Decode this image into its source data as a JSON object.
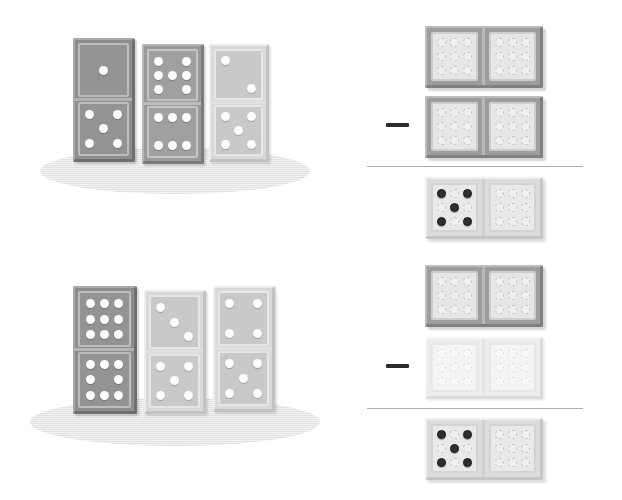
{
  "page": {
    "background_color": "#ffffff",
    "accent_dark": "#2e2e2e",
    "rule_color": "#aeaeae",
    "shadow_color": "#e2e2e2"
  },
  "problems": [
    {
      "id": "problem-1",
      "standing_dominoes": [
        {
          "name": "domino-1",
          "tone": "dark",
          "top_pips": 1,
          "bottom_pips": 5,
          "top_pattern": [
            0,
            0,
            0,
            0,
            1,
            0,
            0,
            0,
            0
          ],
          "bottom_pattern": [
            1,
            0,
            1,
            0,
            1,
            0,
            1,
            0,
            1
          ]
        },
        {
          "name": "domino-2",
          "tone": "mid",
          "top_pips": 7,
          "bottom_pips": 6,
          "top_pattern": [
            1,
            0,
            1,
            1,
            1,
            1,
            1,
            0,
            1
          ],
          "bottom_pattern": [
            1,
            1,
            1,
            0,
            0,
            0,
            1,
            1,
            1
          ]
        },
        {
          "name": "domino-3",
          "tone": "light",
          "top_pips": 2,
          "bottom_pips": 5,
          "top_pattern": [
            1,
            0,
            0,
            0,
            0,
            0,
            0,
            0,
            1
          ],
          "bottom_pattern": [
            1,
            0,
            1,
            0,
            1,
            0,
            1,
            0,
            1
          ]
        }
      ],
      "equation": {
        "operator": "minus",
        "minuend": {
          "name": "minuend-domino",
          "tone": "dark",
          "left_pattern": [
            0,
            0,
            0,
            0,
            0,
            0,
            0,
            0,
            0
          ],
          "right_pattern": [
            0,
            0,
            0,
            0,
            0,
            0,
            0,
            0,
            0
          ]
        },
        "subtrahend": {
          "name": "subtrahend-domino",
          "tone": "dark",
          "left_pattern": [
            0,
            0,
            0,
            0,
            0,
            0,
            0,
            0,
            0
          ],
          "right_pattern": [
            0,
            0,
            0,
            0,
            0,
            0,
            0,
            0,
            0
          ]
        },
        "result": {
          "name": "result-domino",
          "tone": "result",
          "left_pattern": [
            1,
            0,
            1,
            0,
            1,
            0,
            1,
            0,
            1
          ],
          "right_pattern": [
            0,
            0,
            0,
            0,
            0,
            0,
            0,
            0,
            0
          ],
          "left_pips": 5,
          "right_pips": 0
        }
      }
    },
    {
      "id": "problem-2",
      "standing_dominoes": [
        {
          "name": "domino-1",
          "tone": "dark",
          "top_pips": 9,
          "bottom_pips": 8,
          "top_pattern": [
            1,
            1,
            1,
            1,
            1,
            1,
            1,
            1,
            1
          ],
          "bottom_pattern": [
            1,
            1,
            1,
            1,
            0,
            1,
            1,
            1,
            1
          ]
        },
        {
          "name": "domino-2",
          "tone": "light",
          "top_pips": 3,
          "bottom_pips": 5,
          "top_pattern": [
            1,
            0,
            0,
            0,
            1,
            0,
            0,
            0,
            1
          ],
          "bottom_pattern": [
            1,
            0,
            1,
            0,
            1,
            0,
            1,
            0,
            1
          ]
        },
        {
          "name": "domino-3",
          "tone": "light",
          "top_pips": 4,
          "bottom_pips": 5,
          "top_pattern": [
            1,
            0,
            1,
            0,
            0,
            0,
            1,
            0,
            1
          ],
          "bottom_pattern": [
            1,
            0,
            1,
            0,
            1,
            0,
            1,
            0,
            1
          ]
        }
      ],
      "equation": {
        "operator": "minus",
        "minuend": {
          "name": "minuend-domino",
          "tone": "dark",
          "left_pattern": [
            0,
            0,
            0,
            0,
            0,
            0,
            0,
            0,
            0
          ],
          "right_pattern": [
            0,
            0,
            0,
            0,
            0,
            0,
            0,
            0,
            0
          ]
        },
        "subtrahend": {
          "name": "subtrahend-domino",
          "tone": "pale",
          "left_pattern": [
            0,
            0,
            0,
            0,
            0,
            0,
            0,
            0,
            0
          ],
          "right_pattern": [
            0,
            0,
            0,
            0,
            0,
            0,
            0,
            0,
            0
          ]
        },
        "result": {
          "name": "result-domino",
          "tone": "result",
          "left_pattern": [
            1,
            0,
            1,
            0,
            1,
            0,
            1,
            0,
            1
          ],
          "right_pattern": [
            0,
            0,
            0,
            0,
            0,
            0,
            0,
            0,
            0
          ],
          "left_pips": 5,
          "right_pips": 0
        }
      }
    }
  ],
  "layout": {
    "standing_group_1": {
      "shadow": {
        "x": 40,
        "y": 148,
        "w": 270,
        "h": 46
      }
    },
    "standing_group_2": {
      "shadow": {
        "x": 30,
        "y": 398,
        "w": 290,
        "h": 48
      }
    },
    "rules": [
      {
        "x": 367,
        "y": 166,
        "w": 216
      },
      {
        "x": 367,
        "y": 408,
        "w": 216
      }
    ],
    "minus_signs": [
      {
        "x": 386,
        "y": 124,
        "w": 22,
        "h": 4
      },
      {
        "x": 386,
        "y": 366,
        "w": 22,
        "h": 4
      }
    ]
  }
}
